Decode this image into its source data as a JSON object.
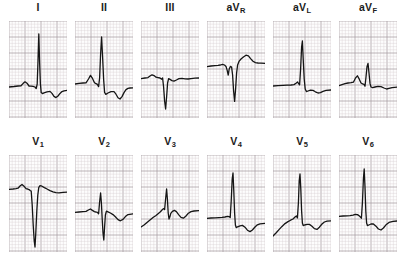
{
  "figure": {
    "grid": {
      "minor_color": "#d9cfd2",
      "major_color": "#a79ba0",
      "background_color": "#fdfdfd",
      "minor_step_px": 3.2,
      "major_every": 5
    },
    "trace": {
      "color": "#151515",
      "width_px": 1.3
    },
    "panel": {
      "width_px": 58,
      "height_px": 97,
      "label_font_size_px": 10.5
    }
  },
  "rows": [
    {
      "name": "limb-leads",
      "leads": [
        {
          "id": "I",
          "label_main": "I",
          "label_sub": "",
          "baseline_y": 66,
          "path": "M0,66 L5,65.5 L9,65 L12,64.8 L14,62.6 L16,60.8 L18,62.2 L20,65 L22,65.2 L24,65.4 L26,66 L27.2,67.6 L28.2,63 L29,40 L29.8,13 L30.6,41 L31.4,63 L32.2,71.6 L33.4,72.6 L35,71.8 L38,70.8 L41,70.4 L43,72.4 L45,75.4 L47,76.6 L49,75 L51,72.4 L53,70.6 L55,69.8 L58,69.4"
        },
        {
          "id": "II",
          "label_main": "II",
          "label_sub": "",
          "baseline_y": 64,
          "path": "M0,63 L4,62.4 L8,62 L11,61.8 L13.5,58 L15.5,54.4 L17.5,57.4 L19.5,61.8 L21,62.6 L22.4,63.4 L23.6,65.6 L24.6,57 L25.6,33 L26.6,16 L27.6,36 L28.6,58 L29.6,71.4 L30.8,73.4 L33,72 L36,70.6 L39,70.6 L41,73.2 L43,76.8 L45,78 L47,75.6 L49,71.6 L51,68.6 L53,67.4 L55,67 L58,66.8"
        },
        {
          "id": "III",
          "label_main": "III",
          "label_sub": "",
          "baseline_y": 56,
          "path": "M0,57.6 L4,57 L7,56.6 L9,55 L11,53.8 L13,54.6 L15,56.2 L17,56.6 L19,57 L20.6,58.2 L21.6,57 L22.6,66 L23.6,80 L24.6,88 L25.6,76 L26.6,62 L27.6,57.6 L29,58.4 L31,59.6 L33,60.2 L35.4,59 L38,57.6 L41,57.4 L44,57.8 L47,58 L50,57.6 L54,57.2 L58,57"
        },
        {
          "id": "aVR",
          "label_main": "aV",
          "label_sub": "R",
          "baseline_y": 44,
          "path": "M0,45.6 L4,45 L8,44.6 L11,44.4 L13.5,44 L15.5,43.4 L17.5,44 L19,45.4 L20.2,49.4 L21.2,54.2 L22.2,48 L23.4,45.4 L24.6,46 L25.6,54 L26.6,70 L27.6,80.4 L28.6,68 L29.6,52 L30.6,44 L32,40.4 L34,38 L36.4,36 L39,34.2 L41.4,34.8 L43.6,37.6 L46,40.2 L48.4,41.6 L51,42 L54,42.2 L58,42.4"
        },
        {
          "id": "aVL",
          "label_main": "aV",
          "label_sub": "L",
          "baseline_y": 64,
          "path": "M0,65 L5,64.6 L10,64.4 L14,64.2 L18,64 L21,63.6 L23,62.2 L24.6,61 L25.6,62.6 L26.6,63.8 L27.6,48 L28.6,26 L29.4,20 L30.2,38 L31.2,58 L32.2,68 L33.4,70.6 L35,70 L37.4,69.2 L40,69.4 L42.4,70.8 L45,72 L47.4,71.6 L50,70.4 L53,69.4 L58,69"
        },
        {
          "id": "aVF",
          "label_main": "aV",
          "label_sub": "F",
          "baseline_y": 62,
          "path": "M0,64.6 L3,63.6 L6,62.6 L9,62 L12,61.6 L14.4,61.2 L16.4,57.2 L18.4,54.8 L20.4,58.4 L22,62 L23.6,62.8 L25,63.4 L26,65.2 L27,56 L28,45.6 L29,42.4 L30,52 L31,62.4 L32,66 L33.6,66.6 L36,66 L39,65.4 L42,65.6 L45,67 L47.6,68 L50,67.4 L53,66.6 L58,66.2"
        }
      ]
    },
    {
      "name": "chest-leads",
      "leads": [
        {
          "id": "V1",
          "label_main": "V",
          "label_sub": "1",
          "baseline_y": 34,
          "path": "M0,34.4 L4,34 L7,33.6 L9,33.2 L11,31 L13,29.4 L15,31.2 L17,33.6 L18.6,34 L20,34.6 L21.2,35.6 L22.2,36 L23.2,50 L24.2,70 L25.2,86 L26,92 L26.8,78 L27.8,56 L28.8,40 L29.8,32.4 L31,30.6 L33,31.2 L35.4,32.6 L38,34 L41,35.6 L44,36.8 L47,37.6 L50,37.8 L54,37.4 L58,37.2"
        },
        {
          "id": "V2",
          "label_main": "V",
          "label_sub": "2",
          "baseline_y": 56,
          "path": "M0,57.4 L4,57 L8,56.6 L11,56.4 L13.4,55 L15.4,54 L17.4,55.4 L19.4,56.6 L21,57 L22.4,57.4 L23.6,58.8 L24.6,47 L25.6,38 L26.4,48 L27.2,64 L28,78 L28.8,85 L29.6,72 L30.4,60 L31.4,56.2 L33,56.8 L35.4,58 L38,59.6 L40.6,62 L43,64.6 L45.4,65.8 L48,64.4 L50.4,61.6 L53,59.6 L58,58.8"
        },
        {
          "id": "V3",
          "label_main": "V",
          "label_sub": "3",
          "baseline_y": 56,
          "path": "M0,72 L3,70 L6,67.4 L9,65 L12,62.6 L15,60.4 L17.4,58.4 L19.4,56.8 L21,55 L22.4,53.6 L23.6,54.6 L24.6,44 L25.6,34 L26.4,44 L27.2,58 L28,64 L28.8,62 L29.8,58.4 L31.4,56.4 L33.4,55.4 L35.4,56.6 L37.6,59.6 L40,62.4 L42.4,63.2 L45,61 L47.4,58.2 L50,56.6 L53,56 L58,55.6"
        },
        {
          "id": "V4",
          "label_main": "V",
          "label_sub": "4",
          "baseline_y": 62,
          "path": "M0,63.4 L4,63 L8,62.8 L12,62.6 L15,62.4 L18,62 L20.4,61.4 L22,61.6 L23.2,62.6 L24.2,46 L25.2,24 L26,18 L26.8,36 L27.6,58 L28.4,70 L29.2,72.6 L30.6,71.8 L33,70.8 L35.4,70.4 L38,72.2 L40.4,75.2 L43,76.6 L45.4,75 L48,72 L50.4,69.8 L53,68.8 L58,68.4"
        },
        {
          "id": "V5",
          "label_main": "V",
          "label_sub": "5",
          "baseline_y": 64,
          "path": "M0,81 L3,78 L6,74.6 L9,71.4 L12,68.6 L15,66.6 L17.6,65.2 L20,64 L22,62 L23.4,61 L24.4,63 L25.4,48 L26.2,26 L27,19 L27.8,34 L28.6,56 L29.4,68 L30.2,70.6 L31.6,70 L34,69.4 L36.4,69.4 L39,71.2 L41.4,73.6 L44,74.4 L46.4,72.2 L49,69 L51.4,67 L54,66.2 L58,65.8"
        },
        {
          "id": "V6",
          "label_main": "V",
          "label_sub": "6",
          "baseline_y": 60,
          "path": "M0,61.4 L4,61 L8,60.8 L11,60.6 L14,60.2 L16.4,59.4 L18.4,59.6 L20,60.6 L21.4,62 L22.4,63.2 L23.4,48 L24.4,24 L25.2,14 L26,32 L26.8,56 L27.6,68 L28.4,70.6 L29.8,70 L32,69 L34.4,69 L37,71.2 L39.4,74 L42,75 L44.4,73 L47,69.8 L50,67.4 L54,66.4 L58,66"
        }
      ]
    }
  ]
}
